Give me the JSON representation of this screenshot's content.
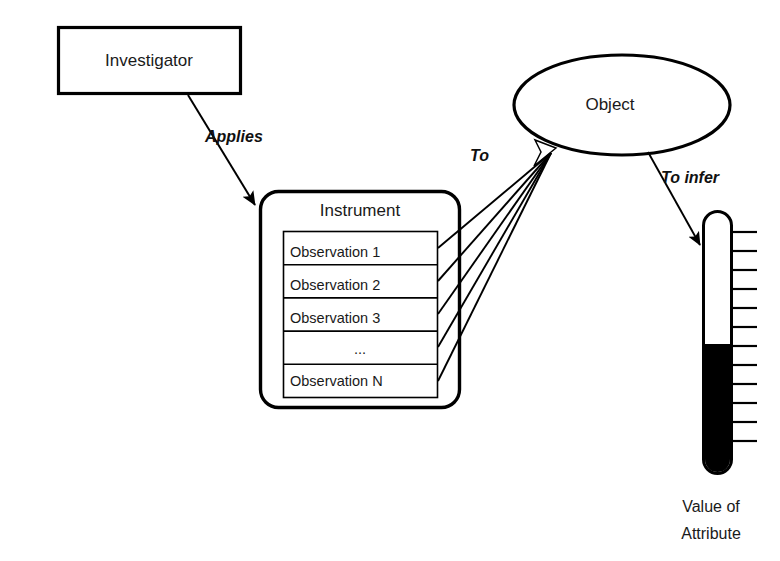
{
  "diagram": {
    "background_color": "#ffffff",
    "stroke_color": "#000000",
    "text_color": "#1a1a1a",
    "fill_color": "#ffffff",
    "nodes": {
      "investigator": {
        "label": "Investigator",
        "shape": "rectangle"
      },
      "instrument": {
        "label": "Instrument",
        "shape": "rounded-rectangle",
        "rows": [
          {
            "label": "Observation 1"
          },
          {
            "label": "Observation 2"
          },
          {
            "label": "Observation 3"
          },
          {
            "label": "..."
          },
          {
            "label": "Observation N"
          }
        ]
      },
      "object": {
        "label": "Object",
        "shape": "ellipse"
      },
      "thermometer": {
        "caption_line_1": "Value of",
        "caption_line_2": "Attribute",
        "shape": "thermometer",
        "fill_level_percent": 50,
        "tick_count": 13,
        "bulb_color": "#000000"
      }
    },
    "edges": {
      "applies": {
        "label": "Applies",
        "from": "investigator",
        "to": "instrument"
      },
      "to": {
        "label": "To",
        "from": "instrument-observations",
        "to": "object"
      },
      "to_infer": {
        "label": "To infer",
        "from": "object",
        "to": "thermometer"
      }
    }
  }
}
